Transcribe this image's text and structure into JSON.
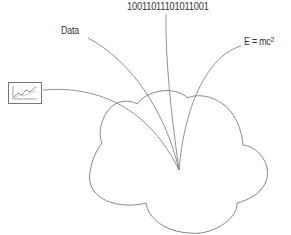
{
  "diagram": {
    "type": "cloud-input-diagram",
    "inputs": [
      {
        "id": "chart",
        "kind": "icon",
        "icon": "line-chart-icon"
      },
      {
        "id": "data",
        "kind": "text",
        "label": "Data"
      },
      {
        "id": "binary",
        "kind": "text",
        "label": "10011011101011001"
      },
      {
        "id": "formula",
        "kind": "text",
        "label": "E = mc",
        "superscript": "2"
      }
    ],
    "target": {
      "id": "cloud",
      "shape": "cloud"
    },
    "colors": {
      "stroke": "#777777",
      "text": "#333333",
      "background": "#ffffff"
    }
  }
}
